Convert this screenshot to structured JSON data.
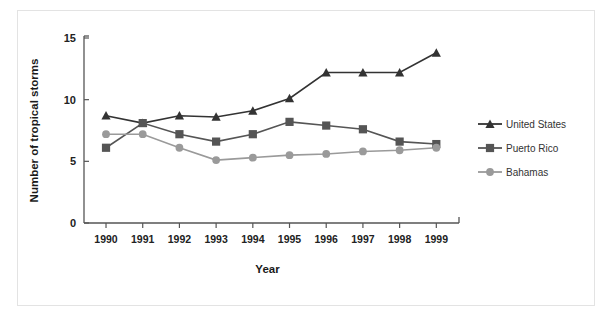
{
  "chart_data": {
    "type": "line",
    "title": "",
    "xlabel": "Year",
    "ylabel": "Number of tropical storms",
    "categories": [
      "1990",
      "1991",
      "1992",
      "1993",
      "1994",
      "1995",
      "1996",
      "1997",
      "1998",
      "1999"
    ],
    "yticks": [
      "0",
      "5",
      "10",
      "15"
    ],
    "ytick_values": [
      0,
      5,
      10,
      15
    ],
    "ylim": [
      0,
      15
    ],
    "grid": false,
    "legend_position": "right",
    "series": [
      {
        "name": "United States",
        "marker": "triangle",
        "color": "#333333",
        "values": [
          8.7,
          8.1,
          8.7,
          8.6,
          9.1,
          10.1,
          12.2,
          12.2,
          12.2,
          13.8
        ]
      },
      {
        "name": "Puerto Rico",
        "marker": "square",
        "color": "#555555",
        "values": [
          6.1,
          8.1,
          7.2,
          6.6,
          7.2,
          8.2,
          7.9,
          7.6,
          6.6,
          6.4
        ]
      },
      {
        "name": "Bahamas",
        "marker": "circle",
        "color": "#9a9a9a",
        "values": [
          7.2,
          7.2,
          6.1,
          5.1,
          5.3,
          5.5,
          5.6,
          5.8,
          5.9,
          6.1
        ]
      }
    ]
  },
  "colors": {
    "united_states": "#333333",
    "puerto_rico": "#555555",
    "bahamas": "#9a9a9a",
    "axis": "#555555",
    "frame": "#e3e3e3",
    "background": "#ffffff"
  }
}
